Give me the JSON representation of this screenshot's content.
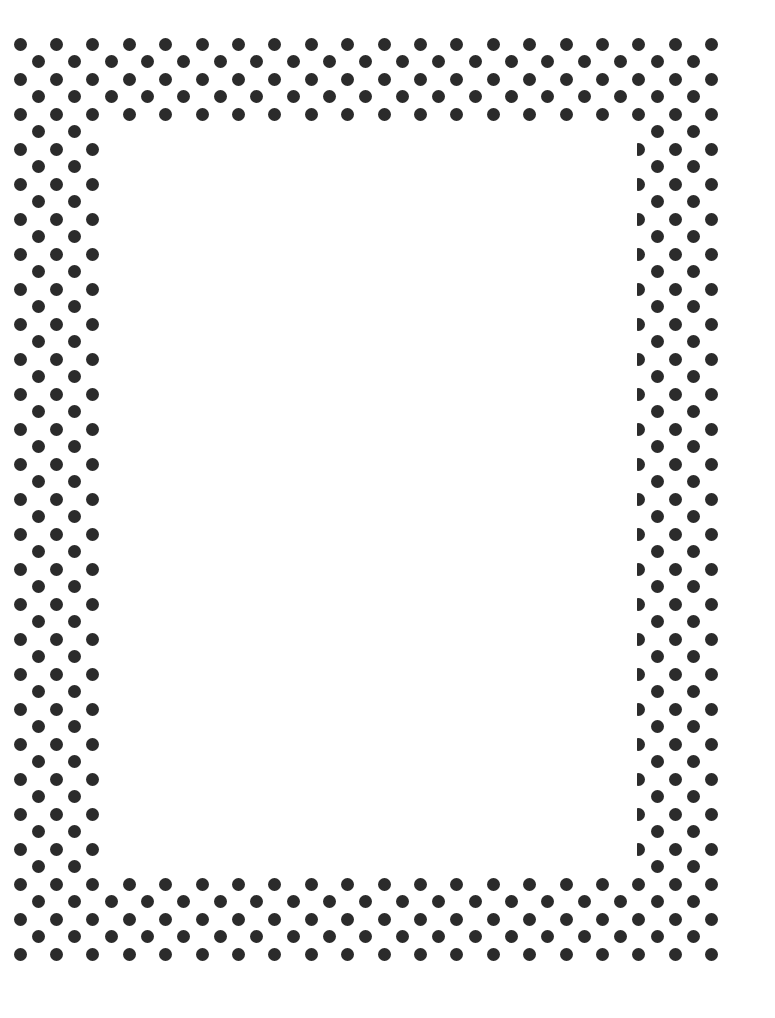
{
  "page": {
    "width": 775,
    "height": 1018,
    "background": "#ffffff"
  },
  "frame": {
    "pattern": "polka-dot-border",
    "dot_color": "#2b2b2b",
    "dot_diameter": 13,
    "origin_x": 20,
    "origin_y": 44,
    "half_col_step": 18.2,
    "row_step": 17.5,
    "total_half_cols": 39,
    "total_rows": 53,
    "band_rows_top": 5,
    "band_rows_bottom": 5,
    "band_half_cols_left": 5,
    "band_half_cols_right": 5
  },
  "inner_area": {
    "x": 105,
    "y": 125,
    "width": 532,
    "height": 745,
    "content": ""
  }
}
